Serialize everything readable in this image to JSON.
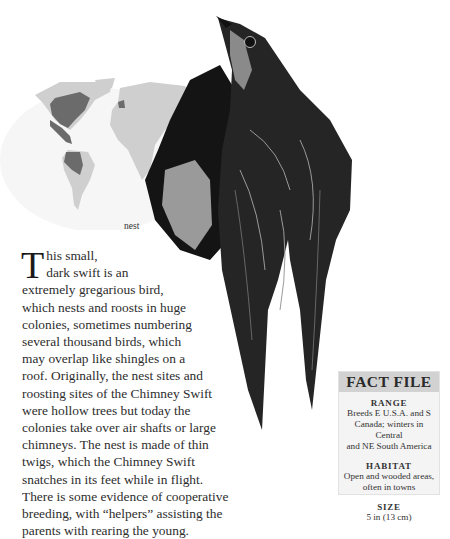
{
  "map": {
    "description": "world map showing range",
    "colors": {
      "land": "#cfcfcf",
      "range": "#6b6b6b"
    }
  },
  "captions": {
    "nest": "nest"
  },
  "article": {
    "dropcap": "T",
    "lines": [
      "his small,",
      "dark swift is an",
      "extremely gregarious bird,",
      "which nests and roosts in huge",
      "colonies, sometimes numbering",
      "several thousand birds, which",
      "may overlap like shingles on a",
      "roof. Originally, the nest sites and",
      "roosting sites of the Chimney Swift",
      "were hollow trees but today the",
      "colonies take over air shafts or large",
      "chimneys. The nest is made of thin",
      "twigs, which the Chimney Swift",
      "snatches in its feet while in flight.",
      "There is some evidence of cooperative",
      "breeding, with “helpers” assisting the",
      "parents with rearing the young."
    ]
  },
  "fact_file": {
    "title": "FACT FILE",
    "sections": [
      {
        "title": "RANGE",
        "lines": [
          "Breeds E U.S.A. and S",
          "Canada; winters in Central",
          "and NE South America"
        ]
      },
      {
        "title": "HABITAT",
        "lines": [
          "Open and wooded areas,",
          "often in towns"
        ]
      },
      {
        "title": "SIZE",
        "lines": [
          "5 in (13 cm)"
        ]
      }
    ]
  }
}
